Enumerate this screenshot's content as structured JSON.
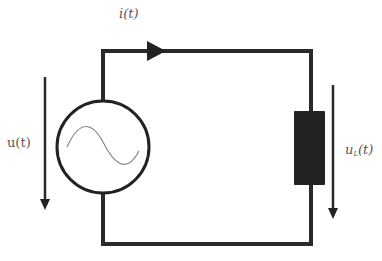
{
  "diagram": {
    "type": "circuit",
    "colors": {
      "wire": "#2a2a2a",
      "component": "#222222",
      "label": "#555555",
      "sine": "#888888",
      "background": "#ffffff"
    },
    "labels": {
      "current": "i(t)",
      "source_voltage": "u(t)",
      "load_voltage_base": "u",
      "load_voltage_sub": "L",
      "load_voltage_arg": "(t)"
    },
    "components": [
      {
        "id": "ac-source",
        "kind": "AC voltage source",
        "symbol": "circle-with-sine"
      },
      {
        "id": "load",
        "kind": "resistor/load",
        "symbol": "filled-rectangle"
      }
    ],
    "arrows": [
      {
        "id": "current-arrow",
        "direction": "right",
        "label": "i(t)"
      },
      {
        "id": "source-voltage-arrow",
        "direction": "down",
        "label": "u(t)"
      },
      {
        "id": "load-voltage-arrow",
        "direction": "down",
        "label": "uL(t)"
      }
    ]
  }
}
